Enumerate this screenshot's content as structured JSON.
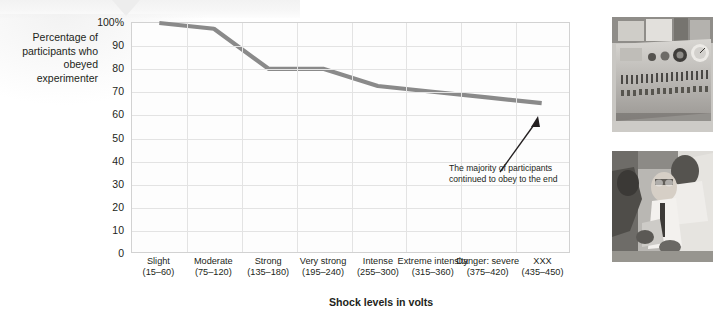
{
  "figure": {
    "y_axis_title": "Percentage of participants who obeyed experimenter",
    "x_axis_title": "Shock levels in volts",
    "annotation": "The majority of participants continued to obey to the end"
  },
  "chart_data": {
    "type": "line",
    "title": "",
    "xlabel": "Shock levels in volts",
    "ylabel": "Percentage of participants who obeyed experimenter",
    "ylim": [
      0,
      100
    ],
    "ytick_labels": [
      "100%",
      "90",
      "80",
      "70",
      "60",
      "50",
      "40",
      "30",
      "20",
      "10",
      "0"
    ],
    "ytick_values": [
      100,
      90,
      80,
      70,
      60,
      50,
      40,
      30,
      20,
      10,
      0
    ],
    "grid": true,
    "legend": "none",
    "categories": [
      {
        "name": "Slight",
        "range": "(15–60)"
      },
      {
        "name": "Moderate",
        "range": "(75–120)"
      },
      {
        "name": "Strong",
        "range": "(135–180)"
      },
      {
        "name": "Very strong",
        "range": "(195–240)"
      },
      {
        "name": "Intense",
        "range": "(255–300)"
      },
      {
        "name": "Extreme intensity",
        "range": "(315–360)"
      },
      {
        "name": "Danger: severe",
        "range": "(375–420)"
      },
      {
        "name": "XXX",
        "range": "(435–450)"
      }
    ],
    "values": [
      100,
      97.5,
      80,
      80,
      72.5,
      70,
      67.5,
      65
    ],
    "series_color": "#8a8a8a",
    "annotations": [
      {
        "text": "The majority of participants continued to obey to the end",
        "points_to_category": "XXX",
        "points_to_value": 65
      }
    ]
  },
  "photos": [
    {
      "name": "shock-generator-photo",
      "caption": ""
    },
    {
      "name": "learner-strapped-in-chair-photo",
      "caption": ""
    }
  ],
  "colors": {
    "line": "#8a8a8a",
    "grid": "#e3e3e3",
    "plot_border": "#d2d2d2",
    "text": "#231f20"
  }
}
